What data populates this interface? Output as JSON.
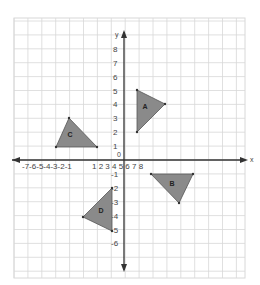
{
  "diagram": {
    "type": "coordinate-plane",
    "axes": {
      "x_label": "x",
      "y_label": "y",
      "origin_label": "0",
      "x_tick_text_negative": "-7-6-5-4-3-2-1",
      "x_tick_text_positive": "1 2 3 4 5 6 7 8",
      "y_ticks_positive": [
        "1",
        "2",
        "3",
        "4",
        "5",
        "6",
        "7",
        "8"
      ],
      "y_ticks_negative": [
        "-1",
        "-2",
        "-3",
        "-4",
        "-5",
        "-6"
      ]
    },
    "colors": {
      "grid": "#d8d8d8",
      "axis": "#333333",
      "triangle_fill": "#8a8a8a",
      "triangle_stroke": "#555555"
    },
    "triangles": [
      {
        "label": "A",
        "vertices_px": [
          [
            137,
            90
          ],
          [
            137,
            132
          ],
          [
            165,
            104
          ]
        ],
        "label_px": [
          145,
          109
        ]
      },
      {
        "label": "B",
        "vertices_px": [
          [
            151,
            174
          ],
          [
            193,
            174
          ],
          [
            179,
            203
          ]
        ],
        "label_px": [
          172,
          186
        ]
      },
      {
        "label": "C",
        "vertices_px": [
          [
            69,
            118
          ],
          [
            56,
            147
          ],
          [
            97,
            147
          ]
        ],
        "label_px": [
          70,
          137
        ]
      },
      {
        "label": "D",
        "vertices_px": [
          [
            112,
            188
          ],
          [
            83,
            217
          ],
          [
            112,
            231
          ]
        ],
        "label_px": [
          101,
          213
        ]
      }
    ]
  }
}
